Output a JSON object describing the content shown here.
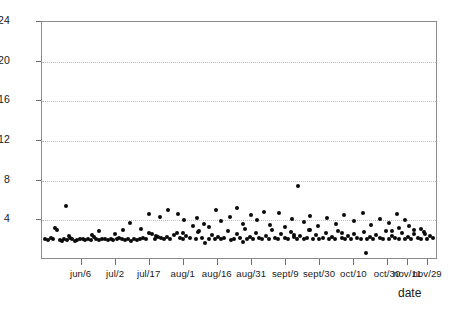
{
  "chart_data": {
    "type": "scatter",
    "title": "",
    "xlabel": "date",
    "ylabel": "",
    "ylim": [
      0,
      24
    ],
    "yticks": [
      4,
      8,
      12,
      16,
      20,
      24
    ],
    "ytick_labels": [
      "4",
      "8",
      "12",
      "16",
      "20",
      "24"
    ],
    "grid": true,
    "grid_style": "dotted",
    "legend": "none",
    "marker": "filled-circle",
    "marker_color": "#0a0a0a",
    "xtick_labels": [
      "jun/6",
      "jul/2",
      "jul/17",
      "aug/1",
      "aug/16",
      "aug/31",
      "sept/9",
      "sept/30",
      "oct/10",
      "oct/30",
      "nov/11",
      "nov/29"
    ],
    "xtick_positions": [
      0.1,
      0.187,
      0.272,
      0.358,
      0.444,
      0.531,
      0.617,
      0.702,
      0.789,
      0.874,
      0.925,
      0.975
    ],
    "points": [
      [
        0.01,
        2.0
      ],
      [
        0.017,
        1.9
      ],
      [
        0.024,
        2.1
      ],
      [
        0.031,
        2.0
      ],
      [
        0.036,
        3.1
      ],
      [
        0.041,
        2.9
      ],
      [
        0.047,
        1.9
      ],
      [
        0.053,
        1.8
      ],
      [
        0.059,
        2.0
      ],
      [
        0.066,
        1.9
      ],
      [
        0.072,
        2.1
      ],
      [
        0.079,
        2.0
      ],
      [
        0.085,
        1.8
      ],
      [
        0.092,
        1.9
      ],
      [
        0.098,
        2.0
      ],
      [
        0.062,
        5.3
      ],
      [
        0.105,
        2.0
      ],
      [
        0.112,
        1.9
      ],
      [
        0.118,
        2.0
      ],
      [
        0.126,
        1.9
      ],
      [
        0.133,
        2.2
      ],
      [
        0.14,
        2.0
      ],
      [
        0.147,
        1.9
      ],
      [
        0.154,
        2.0
      ],
      [
        0.147,
        2.8
      ],
      [
        0.162,
        2.0
      ],
      [
        0.169,
        1.9
      ],
      [
        0.176,
        2.0
      ],
      [
        0.183,
        1.9
      ],
      [
        0.191,
        2.0
      ],
      [
        0.198,
        2.1
      ],
      [
        0.205,
        2.0
      ],
      [
        0.213,
        1.9
      ],
      [
        0.22,
        2.0
      ],
      [
        0.228,
        1.8
      ],
      [
        0.208,
        2.9
      ],
      [
        0.235,
        2.0
      ],
      [
        0.243,
        1.9
      ],
      [
        0.25,
        2.0
      ],
      [
        0.258,
        2.1
      ],
      [
        0.226,
        3.6
      ],
      [
        0.265,
        2.0
      ],
      [
        0.272,
        2.6
      ],
      [
        0.28,
        2.5
      ],
      [
        0.288,
        2.0
      ],
      [
        0.296,
        2.2
      ],
      [
        0.273,
        4.5
      ],
      [
        0.304,
        2.1
      ],
      [
        0.311,
        2.0
      ],
      [
        0.319,
        2.2
      ],
      [
        0.3,
        4.2
      ],
      [
        0.327,
        2.0
      ],
      [
        0.335,
        2.4
      ],
      [
        0.343,
        2.6
      ],
      [
        0.32,
        4.9
      ],
      [
        0.351,
        2.1
      ],
      [
        0.359,
        2.0
      ],
      [
        0.367,
        2.3
      ],
      [
        0.345,
        4.5
      ],
      [
        0.375,
        2.1
      ],
      [
        0.383,
        3.3
      ],
      [
        0.391,
        2.0
      ],
      [
        0.399,
        2.8
      ],
      [
        0.36,
        3.9
      ],
      [
        0.407,
        2.1
      ],
      [
        0.415,
        1.6
      ],
      [
        0.423,
        2.0
      ],
      [
        0.431,
        2.4
      ],
      [
        0.395,
        4.1
      ],
      [
        0.439,
        2.0
      ],
      [
        0.411,
        3.5
      ],
      [
        0.447,
        2.2
      ],
      [
        0.455,
        2.0
      ],
      [
        0.425,
        3.2
      ],
      [
        0.463,
        2.1
      ],
      [
        0.471,
        2.8
      ],
      [
        0.479,
        1.9
      ],
      [
        0.443,
        4.9
      ],
      [
        0.487,
        2.0
      ],
      [
        0.495,
        2.5
      ],
      [
        0.455,
        3.8
      ],
      [
        0.503,
        2.1
      ],
      [
        0.511,
        1.7
      ],
      [
        0.519,
        2.0
      ],
      [
        0.478,
        4.2
      ],
      [
        0.527,
        2.2
      ],
      [
        0.535,
        2.0
      ],
      [
        0.543,
        2.6
      ],
      [
        0.496,
        5.1
      ],
      [
        0.551,
        2.1
      ],
      [
        0.51,
        3.5
      ],
      [
        0.559,
        2.0
      ],
      [
        0.567,
        2.3
      ],
      [
        0.53,
        4.4
      ],
      [
        0.575,
        2.0
      ],
      [
        0.583,
        2.9
      ],
      [
        0.591,
        2.1
      ],
      [
        0.546,
        3.9
      ],
      [
        0.599,
        2.0
      ],
      [
        0.607,
        2.5
      ],
      [
        0.562,
        4.7
      ],
      [
        0.615,
        2.1
      ],
      [
        0.623,
        2.0
      ],
      [
        0.631,
        2.7
      ],
      [
        0.578,
        3.4
      ],
      [
        0.639,
        2.2
      ],
      [
        0.647,
        2.0
      ],
      [
        0.655,
        2.3
      ],
      [
        0.6,
        4.6
      ],
      [
        0.663,
        2.0
      ],
      [
        0.671,
        2.1
      ],
      [
        0.679,
        2.9
      ],
      [
        0.617,
        3.2
      ],
      [
        0.687,
        2.0
      ],
      [
        0.695,
        2.4
      ],
      [
        0.703,
        2.0
      ],
      [
        0.634,
        4.0
      ],
      [
        0.711,
        2.1
      ],
      [
        0.719,
        2.6
      ],
      [
        0.727,
        2.0
      ],
      [
        0.649,
        7.4
      ],
      [
        0.735,
        2.2
      ],
      [
        0.743,
        2.0
      ],
      [
        0.751,
        2.8
      ],
      [
        0.664,
        3.7
      ],
      [
        0.759,
        2.1
      ],
      [
        0.767,
        2.0
      ],
      [
        0.775,
        2.3
      ],
      [
        0.68,
        4.3
      ],
      [
        0.783,
        2.0
      ],
      [
        0.791,
        2.5
      ],
      [
        0.799,
        2.1
      ],
      [
        0.7,
        3.3
      ],
      [
        0.807,
        2.0
      ],
      [
        0.815,
        2.7
      ],
      [
        0.823,
        2.0
      ],
      [
        0.723,
        4.1
      ],
      [
        0.831,
        2.2
      ],
      [
        0.839,
        2.0
      ],
      [
        0.847,
        2.4
      ],
      [
        0.745,
        3.5
      ],
      [
        0.855,
        2.1
      ],
      [
        0.863,
        2.0
      ],
      [
        0.871,
        2.8
      ],
      [
        0.766,
        4.4
      ],
      [
        0.879,
        2.0
      ],
      [
        0.887,
        2.3
      ],
      [
        0.895,
        2.1
      ],
      [
        0.79,
        3.8
      ],
      [
        0.903,
        2.0
      ],
      [
        0.911,
        2.6
      ],
      [
        0.919,
        2.0
      ],
      [
        0.812,
        4.6
      ],
      [
        0.927,
        2.2
      ],
      [
        0.935,
        2.0
      ],
      [
        0.943,
        2.5
      ],
      [
        0.833,
        3.4
      ],
      [
        0.951,
        2.1
      ],
      [
        0.959,
        2.0
      ],
      [
        0.967,
        2.7
      ],
      [
        0.855,
        4.0
      ],
      [
        0.975,
        2.0
      ],
      [
        0.983,
        2.3
      ],
      [
        0.878,
        3.6
      ],
      [
        0.991,
        2.1
      ],
      [
        0.898,
        4.5
      ],
      [
        0.905,
        3.1
      ],
      [
        0.918,
        3.9
      ],
      [
        0.93,
        3.3
      ],
      [
        0.942,
        2.9
      ],
      [
        0.82,
        0.6
      ],
      [
        0.252,
        3.0
      ],
      [
        0.396,
        2.7
      ],
      [
        0.188,
        2.5
      ],
      [
        0.516,
        3.0
      ],
      [
        0.676,
        2.9
      ],
      [
        0.76,
        2.6
      ],
      [
        0.886,
        2.8
      ],
      [
        0.96,
        3.0
      ],
      [
        0.64,
        2.4
      ],
      [
        0.358,
        2.6
      ],
      [
        0.29,
        2.3
      ],
      [
        0.128,
        2.4
      ],
      [
        0.07,
        2.3
      ],
      [
        0.97,
        2.5
      ]
    ]
  }
}
